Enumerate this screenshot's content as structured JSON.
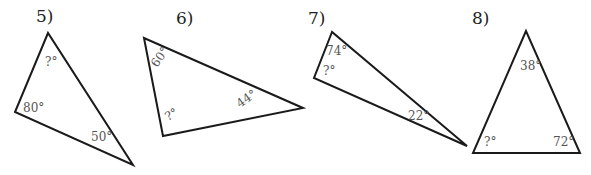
{
  "problems": [
    {
      "number": "5)",
      "angles": {
        "top": "?°",
        "left": "80°",
        "bottom_right": "50°"
      }
    },
    {
      "number": "6)",
      "angles": {
        "top_left": "60°",
        "bottom": "?°",
        "right": "44°"
      }
    },
    {
      "number": "7)",
      "angles": {
        "top": "74°",
        "left": "?°",
        "bottom_right": "22°"
      }
    },
    {
      "number": "8)",
      "angles": {
        "top": "38°",
        "bottom_left": "?°",
        "bottom_right": "72°"
      }
    }
  ],
  "colors": {
    "line": "#1a1a1a",
    "number": "#222222",
    "angle_label": "#555555",
    "background": "#ffffff"
  }
}
